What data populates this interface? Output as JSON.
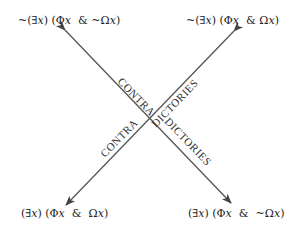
{
  "diagram": {
    "type": "square-of-opposition-contradictories",
    "colors": {
      "line": "#555555",
      "text": "#222222",
      "background": "#ffffff"
    },
    "corners": {
      "top_left": {
        "parts": [
          "~(∃",
          "x",
          ") (Φ",
          "x",
          "  & ~Ω",
          "x",
          ")"
        ]
      },
      "top_right": {
        "parts": [
          "~(∃",
          "x",
          ") (Φ",
          "x",
          "  & Ω",
          "x",
          ")"
        ]
      },
      "bottom_left": {
        "parts": [
          "(∃",
          "x",
          ") (Φ",
          "x",
          "  &  Ω",
          "x",
          ")"
        ]
      },
      "bottom_right": {
        "parts": [
          "(∃",
          "x",
          ") (Φ",
          "x",
          "  &  ~Ω",
          "x",
          ")"
        ]
      }
    },
    "diagonal_labels": {
      "upper_left_segment": "CONTRA",
      "upper_right_segment": "DICTORIES",
      "lower_left_segment": "CONTRA",
      "lower_right_segment": "DICTORIES"
    }
  }
}
